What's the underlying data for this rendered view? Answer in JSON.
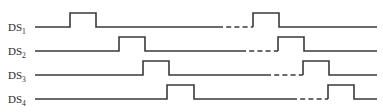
{
  "figure": {
    "title": "",
    "type": "digital-timing-diagram",
    "width": 383,
    "height": 112,
    "background_color": "#ffffff",
    "line_color": "#3a3a3a",
    "label_color": "#2a2a2a"
  },
  "chart_data": {
    "type": "line",
    "title": "",
    "xlabel": "",
    "ylabel": "",
    "grid": false,
    "legend": false,
    "signals": [
      {
        "name": "DS1",
        "label_text": "DS",
        "label_subscript": "1",
        "baseline_y": 27,
        "high_y": 13,
        "line_start_x": 35,
        "line_end_x": 377,
        "pulses": [
          {
            "rise_x": 70,
            "fall_x": 96
          },
          {
            "rise_x": 253,
            "fall_x": 279
          }
        ],
        "break": {
          "start_x": 218,
          "end_x": 253
        }
      },
      {
        "name": "DS2",
        "label_text": "DS",
        "label_subscript": "2",
        "baseline_y": 51,
        "high_y": 37,
        "line_start_x": 35,
        "line_end_x": 377,
        "pulses": [
          {
            "rise_x": 119,
            "fall_x": 145
          },
          {
            "rise_x": 278,
            "fall_x": 304
          }
        ],
        "break": {
          "start_x": 241,
          "end_x": 278
        }
      },
      {
        "name": "DS3",
        "label_text": "DS",
        "label_subscript": "3",
        "baseline_y": 75,
        "high_y": 61,
        "line_start_x": 35,
        "line_end_x": 377,
        "pulses": [
          {
            "rise_x": 143,
            "fall_x": 169
          },
          {
            "rise_x": 303,
            "fall_x": 329
          }
        ],
        "break": {
          "start_x": 266,
          "end_x": 303
        }
      },
      {
        "name": "DS4",
        "label_text": "DS",
        "label_subscript": "4",
        "baseline_y": 99,
        "high_y": 85,
        "line_start_x": 35,
        "line_end_x": 377,
        "pulses": [
          {
            "rise_x": 167,
            "fall_x": 194
          },
          {
            "rise_x": 328,
            "fall_x": 354
          }
        ],
        "break": {
          "start_x": 292,
          "end_x": 328
        }
      }
    ],
    "labels": [
      {
        "text": "DS",
        "subscript": "1",
        "x": 8,
        "y": 31
      },
      {
        "text": "DS",
        "subscript": "2",
        "x": 8,
        "y": 55
      },
      {
        "text": "DS",
        "subscript": "3",
        "x": 8,
        "y": 79
      },
      {
        "text": "DS",
        "subscript": "4",
        "x": 8,
        "y": 103
      }
    ]
  }
}
